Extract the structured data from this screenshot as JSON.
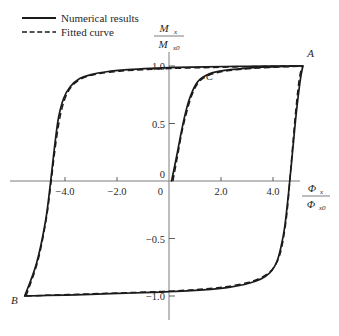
{
  "chart_data": {
    "type": "line",
    "title": "",
    "subtitle": "",
    "xlabel_num": "Φ",
    "xlabel_num_sub": "x",
    "xlabel_den": "Φ",
    "xlabel_den_sub": "x0",
    "ylabel_num": "M",
    "ylabel_num_sub": "x",
    "ylabel_den": "M",
    "ylabel_den_sub": "x0",
    "xlim": [
      -6.5,
      6.5
    ],
    "ylim": [
      -1.25,
      1.15
    ],
    "xticks": [
      -4.0,
      -2.0,
      0,
      2.0,
      4.0
    ],
    "xtick_labels": [
      "−4.0",
      "−2.0",
      "0",
      "2.0",
      "4.0"
    ],
    "yticks": [
      1.0,
      0.5,
      0,
      -0.5,
      -1.0
    ],
    "ytick_labels": [
      "1.0",
      "0.5",
      "0",
      "−0.5",
      "−1.0"
    ],
    "grid": false,
    "legend_position": "top-left",
    "series": [
      {
        "name": "Numerical results",
        "style": "solid",
        "color": "#1b1b1b",
        "branches": [
          {
            "name": "upper-branch",
            "points": [
              [
                -5.55,
                -1.0
              ],
              [
                -5.1,
                -0.72
              ],
              [
                -4.75,
                -0.35
              ],
              [
                -4.55,
                0.0
              ],
              [
                -4.4,
                0.3
              ],
              [
                -4.25,
                0.55
              ],
              [
                -4.05,
                0.72
              ],
              [
                -3.8,
                0.82
              ],
              [
                -3.45,
                0.89
              ],
              [
                -3.0,
                0.925
              ],
              [
                -2.4,
                0.95
              ],
              [
                -1.6,
                0.968
              ],
              [
                -0.7,
                0.98
              ],
              [
                0.3,
                0.988
              ],
              [
                1.4,
                0.993
              ],
              [
                2.6,
                0.997
              ],
              [
                3.8,
                0.999
              ],
              [
                4.7,
                1.0
              ],
              [
                5.15,
                1.0
              ]
            ]
          },
          {
            "name": "lower-branch",
            "points": [
              [
                -5.55,
                -1.0
              ],
              [
                -4.7,
                -0.995
              ],
              [
                -3.6,
                -0.99
              ],
              [
                -2.5,
                -0.982
              ],
              [
                -1.4,
                -0.974
              ],
              [
                -0.3,
                -0.966
              ],
              [
                0.7,
                -0.956
              ],
              [
                1.6,
                -0.942
              ],
              [
                2.3,
                -0.925
              ],
              [
                2.9,
                -0.9
              ],
              [
                3.35,
                -0.87
              ],
              [
                3.7,
                -0.83
              ],
              [
                3.95,
                -0.78
              ],
              [
                4.15,
                -0.7
              ],
              [
                4.3,
                -0.58
              ],
              [
                4.45,
                -0.4
              ],
              [
                4.6,
                -0.1
              ],
              [
                4.75,
                0.25
              ],
              [
                4.9,
                0.6
              ],
              [
                5.05,
                0.88
              ],
              [
                5.15,
                1.0
              ]
            ]
          },
          {
            "name": "minor-ascending-branch",
            "points": [
              [
                0.1,
                0.0
              ],
              [
                0.28,
                0.2
              ],
              [
                0.45,
                0.4
              ],
              [
                0.6,
                0.56
              ],
              [
                0.75,
                0.69
              ],
              [
                0.9,
                0.78
              ],
              [
                1.05,
                0.845
              ],
              [
                1.2,
                0.885
              ],
              [
                1.4,
                0.915
              ],
              [
                1.65,
                0.94
              ],
              [
                1.95,
                0.955
              ],
              [
                2.35,
                0.968
              ],
              [
                2.9,
                0.98
              ],
              [
                3.6,
                0.99
              ],
              [
                4.4,
                0.996
              ],
              [
                5.0,
                1.0
              ]
            ]
          }
        ]
      },
      {
        "name": "Fitted curve",
        "style": "dashed",
        "color": "#1b1b1b",
        "branches": [
          {
            "name": "upper-branch-fit",
            "points": [
              [
                -5.5,
                -1.0
              ],
              [
                -5.05,
                -0.7
              ],
              [
                -4.72,
                -0.33
              ],
              [
                -4.52,
                0.02
              ],
              [
                -4.34,
                0.35
              ],
              [
                -4.15,
                0.6
              ],
              [
                -3.92,
                0.76
              ],
              [
                -3.62,
                0.85
              ],
              [
                -3.2,
                0.905
              ],
              [
                -2.65,
                0.935
              ],
              [
                -1.9,
                0.955
              ],
              [
                -1.0,
                0.968
              ],
              [
                0.0,
                0.978
              ],
              [
                1.2,
                0.985
              ],
              [
                2.5,
                0.992
              ],
              [
                3.8,
                0.997
              ],
              [
                4.8,
                1.0
              ],
              [
                5.15,
                1.0
              ]
            ]
          },
          {
            "name": "lower-branch-fit",
            "points": [
              [
                -5.5,
                -1.0
              ],
              [
                -4.6,
                -0.993
              ],
              [
                -3.5,
                -0.985
              ],
              [
                -2.4,
                -0.977
              ],
              [
                -1.3,
                -0.969
              ],
              [
                -0.2,
                -0.96
              ],
              [
                0.8,
                -0.948
              ],
              [
                1.7,
                -0.932
              ],
              [
                2.4,
                -0.912
              ],
              [
                3.0,
                -0.885
              ],
              [
                3.45,
                -0.85
              ],
              [
                3.8,
                -0.805
              ],
              [
                4.05,
                -0.745
              ],
              [
                4.25,
                -0.65
              ],
              [
                4.4,
                -0.5
              ],
              [
                4.55,
                -0.25
              ],
              [
                4.7,
                0.15
              ],
              [
                4.85,
                0.55
              ],
              [
                5.0,
                0.87
              ],
              [
                5.12,
                1.0
              ]
            ]
          },
          {
            "name": "minor-ascending-branch-fit",
            "points": [
              [
                0.15,
                0.0
              ],
              [
                0.33,
                0.22
              ],
              [
                0.5,
                0.43
              ],
              [
                0.66,
                0.58
              ],
              [
                0.82,
                0.71
              ],
              [
                0.98,
                0.8
              ],
              [
                1.14,
                0.858
              ],
              [
                1.32,
                0.895
              ],
              [
                1.55,
                0.922
              ],
              [
                1.85,
                0.942
              ],
              [
                2.2,
                0.957
              ],
              [
                2.7,
                0.97
              ],
              [
                3.4,
                0.982
              ],
              [
                4.2,
                0.991
              ],
              [
                5.0,
                0.997
              ]
            ]
          }
        ]
      }
    ],
    "annotations": [
      {
        "label": "A",
        "x": 5.45,
        "y": 1.08
      },
      {
        "label": "B",
        "x": -5.95,
        "y": -1.07
      },
      {
        "label": "C",
        "x": 1.55,
        "y": 0.88
      }
    ]
  },
  "legend": {
    "items": [
      {
        "label": "Numerical results",
        "style": "solid"
      },
      {
        "label": "Fitted curve",
        "style": "dashed"
      }
    ]
  }
}
